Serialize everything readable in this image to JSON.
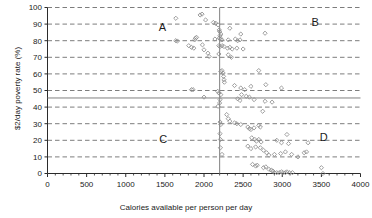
{
  "chart_data": {
    "type": "scatter",
    "title": "",
    "xlabel": "Calories available per person per day",
    "ylabel": "$2/day poverty rate (%)",
    "xlim": [
      0,
      4000
    ],
    "ylim": [
      0,
      100
    ],
    "xticks": [
      0,
      500,
      1000,
      1500,
      2000,
      2500,
      3000,
      3500,
      4000
    ],
    "yticks": [
      0,
      10,
      20,
      30,
      40,
      50,
      60,
      70,
      80,
      90,
      100
    ],
    "grid": "horizontal-dashed",
    "legend": "none",
    "marker": "open-diamond",
    "marker_color": "#8c8c8c",
    "reference_lines": [
      {
        "orientation": "vertical",
        "value": 2200,
        "axis": "x",
        "style": "solid",
        "color": "#808080"
      },
      {
        "orientation": "horizontal",
        "value": 45.5,
        "axis": "y",
        "style": "solid",
        "color": "#808080"
      }
    ],
    "annotations": [
      {
        "label": "A",
        "x": 1470,
        "y": 88
      },
      {
        "label": "B",
        "x": 3420,
        "y": 91
      },
      {
        "label": "C",
        "x": 1480,
        "y": 21
      },
      {
        "label": "D",
        "x": 3530,
        "y": 22
      }
    ],
    "points": [
      [
        1640,
        93.5
      ],
      [
        1950,
        95.5
      ],
      [
        1975,
        96.0
      ],
      [
        2020,
        92.5
      ],
      [
        2120,
        91.0
      ],
      [
        2150,
        90.5
      ],
      [
        2180,
        89.5
      ],
      [
        2195,
        86.5
      ],
      [
        2200,
        85.5
      ],
      [
        2215,
        84.0
      ],
      [
        2205,
        83.0
      ],
      [
        2330,
        87.5
      ],
      [
        2470,
        84.0
      ],
      [
        2780,
        84.5
      ],
      [
        1640,
        80.0
      ],
      [
        1660,
        79.8
      ],
      [
        1890,
        81.5
      ],
      [
        1905,
        82.0
      ],
      [
        1880,
        80.5
      ],
      [
        2140,
        81.0
      ],
      [
        2195,
        81.5
      ],
      [
        2210,
        81.0
      ],
      [
        2230,
        80.5
      ],
      [
        2310,
        80.5
      ],
      [
        2400,
        81.0
      ],
      [
        2430,
        80.0
      ],
      [
        2460,
        80.5
      ],
      [
        1840,
        76.0
      ],
      [
        1870,
        75.5
      ],
      [
        1805,
        77.0
      ],
      [
        1980,
        77.5
      ],
      [
        2000,
        74.5
      ],
      [
        2050,
        72.5
      ],
      [
        2065,
        70.5
      ],
      [
        2190,
        77.0
      ],
      [
        2205,
        76.5
      ],
      [
        2230,
        77.0
      ],
      [
        2255,
        76.5
      ],
      [
        2300,
        75.5
      ],
      [
        2330,
        76.0
      ],
      [
        2360,
        75.0
      ],
      [
        2420,
        75.5
      ],
      [
        2500,
        75.0
      ],
      [
        2190,
        72.0
      ],
      [
        2310,
        71.5
      ],
      [
        2350,
        70.0
      ],
      [
        2215,
        61.5
      ],
      [
        2230,
        62.0
      ],
      [
        2245,
        60.5
      ],
      [
        2250,
        58.5
      ],
      [
        2255,
        56.5
      ],
      [
        2260,
        55.0
      ],
      [
        2700,
        62.0
      ],
      [
        1840,
        50.5
      ],
      [
        1860,
        50.5
      ],
      [
        2000,
        46.0
      ],
      [
        2175,
        49.5
      ],
      [
        2190,
        48.5
      ],
      [
        2215,
        47.5
      ],
      [
        2205,
        44.5
      ],
      [
        2200,
        42.5
      ],
      [
        2180,
        40.5
      ],
      [
        2390,
        53.0
      ],
      [
        2470,
        51.5
      ],
      [
        2520,
        50.5
      ],
      [
        2600,
        52.5
      ],
      [
        2790,
        53.5
      ],
      [
        2990,
        51.5
      ],
      [
        2480,
        47.5
      ],
      [
        2540,
        46.5
      ],
      [
        2580,
        46.0
      ],
      [
        2430,
        45.0
      ],
      [
        2460,
        44.0
      ],
      [
        2640,
        44.5
      ],
      [
        2780,
        43.5
      ],
      [
        2870,
        43.0
      ],
      [
        2750,
        37.5
      ],
      [
        2290,
        35.5
      ],
      [
        2310,
        33.0
      ],
      [
        2330,
        31.5
      ],
      [
        2205,
        31.0
      ],
      [
        2215,
        29.5
      ],
      [
        2390,
        30.5
      ],
      [
        2420,
        30.0
      ],
      [
        2470,
        29.5
      ],
      [
        2560,
        28.0
      ],
      [
        2580,
        27.0
      ],
      [
        2600,
        26.5
      ],
      [
        2640,
        27.5
      ],
      [
        2700,
        29.0
      ],
      [
        2720,
        28.0
      ],
      [
        2205,
        24.0
      ],
      [
        2210,
        20.5
      ],
      [
        2610,
        21.5
      ],
      [
        2650,
        20.5
      ],
      [
        2670,
        19.5
      ],
      [
        2700,
        20.5
      ],
      [
        2730,
        19.0
      ],
      [
        2930,
        20.0
      ],
      [
        2990,
        18.5
      ],
      [
        3060,
        23.5
      ],
      [
        3080,
        18.0
      ],
      [
        3330,
        18.5
      ],
      [
        2210,
        15.5
      ],
      [
        2560,
        16.5
      ],
      [
        2600,
        15.0
      ],
      [
        2660,
        16.0
      ],
      [
        2720,
        15.5
      ],
      [
        2760,
        14.0
      ],
      [
        2800,
        12.5
      ],
      [
        2830,
        11.0
      ],
      [
        2900,
        11.5
      ],
      [
        2980,
        12.0
      ],
      [
        3040,
        13.0
      ],
      [
        3120,
        11.5
      ],
      [
        3200,
        10.0
      ],
      [
        3280,
        12.5
      ],
      [
        3310,
        13.0
      ],
      [
        2230,
        11.5
      ],
      [
        2620,
        5.5
      ],
      [
        2660,
        4.5
      ],
      [
        2680,
        5.0
      ],
      [
        2760,
        3.5
      ],
      [
        2790,
        4.0
      ],
      [
        2830,
        2.5
      ],
      [
        2860,
        2.0
      ],
      [
        2880,
        1.5
      ],
      [
        2900,
        0.5
      ],
      [
        2930,
        0.5
      ],
      [
        2960,
        0.5
      ],
      [
        2990,
        1.0
      ],
      [
        3010,
        0.5
      ],
      [
        3040,
        0.5
      ],
      [
        3060,
        1.0
      ],
      [
        3090,
        0.5
      ],
      [
        3130,
        0.5
      ],
      [
        3500,
        3.5
      ],
      [
        3520,
        0.0
      ]
    ]
  },
  "caption": {
    "continuation_text": ""
  }
}
